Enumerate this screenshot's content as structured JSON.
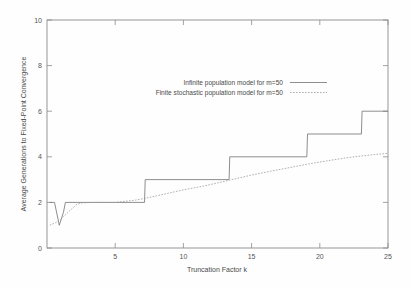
{
  "figure": {
    "background_color": "#fefefe",
    "axis_color": "#8c8c8c",
    "text_color": "#4a4a4a"
  },
  "chart_data": {
    "type": "line",
    "title": "",
    "xlabel": "Truncation Factor k",
    "ylabel": "Average Generations to Fixed-Point Convergence",
    "xlim": [
      0,
      25
    ],
    "ylim": [
      0,
      10
    ],
    "xticks": [
      5,
      10,
      15,
      20,
      25
    ],
    "yticks": [
      0,
      2,
      4,
      6,
      8,
      10
    ],
    "xtick_labels": [
      "5",
      "10",
      "15",
      "20",
      "25"
    ],
    "ytick_labels": [
      "0",
      "2",
      "4",
      "6",
      "8",
      "10"
    ],
    "grid": false,
    "legend_position": "upper-center",
    "series": [
      {
        "name": "Infinite population model for m=50",
        "style": "solid",
        "color": "#7a7a7a",
        "x": [
          0.2,
          0.55,
          0.9,
          1.2,
          1.35,
          7.15,
          7.2,
          13.35,
          13.4,
          19.05,
          19.1,
          23.05,
          23.1,
          25
        ],
        "y": [
          2.0,
          2.0,
          1.0,
          1.55,
          2.0,
          2.0,
          3.0,
          3.0,
          4.0,
          4.0,
          5.0,
          5.0,
          6.0,
          6.0
        ]
      },
      {
        "name": "Finite stochastic population model for m=50",
        "style": "dotted",
        "color": "#9a9a9a",
        "x": [
          0.2,
          0.6,
          1.0,
          1.6,
          2.2,
          2.6,
          3.5,
          5.0,
          6.5,
          7.2,
          8.5,
          10.0,
          11.5,
          13.0,
          13.4,
          15.0,
          16.5,
          18.0,
          19.1,
          20.5,
          22.0,
          23.1,
          24.0,
          25.0
        ],
        "y": [
          1.0,
          1.1,
          1.25,
          1.6,
          1.92,
          1.98,
          2.0,
          2.0,
          2.1,
          2.18,
          2.35,
          2.55,
          2.72,
          2.92,
          2.98,
          3.2,
          3.38,
          3.55,
          3.68,
          3.82,
          3.96,
          4.04,
          4.1,
          4.15
        ]
      }
    ]
  },
  "legend": {
    "entries": [
      {
        "label": "Infinite population model for m=50",
        "style": "solid"
      },
      {
        "label": "Finite stochastic population model for m=50",
        "style": "dotted"
      }
    ]
  }
}
